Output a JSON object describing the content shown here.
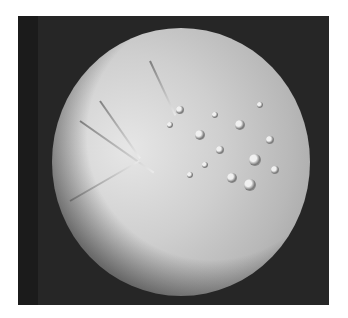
{
  "image": {
    "subject": "icy moon with grooved and cratered terrain",
    "background_color": "#262626",
    "border_color": "#ffffff"
  },
  "craters": [
    {
      "x": 180,
      "y": 110,
      "r": 4
    },
    {
      "x": 200,
      "y": 135,
      "r": 5
    },
    {
      "x": 220,
      "y": 150,
      "r": 4
    },
    {
      "x": 240,
      "y": 125,
      "r": 5
    },
    {
      "x": 255,
      "y": 160,
      "r": 6
    },
    {
      "x": 232,
      "y": 178,
      "r": 5
    },
    {
      "x": 250,
      "y": 185,
      "r": 6
    },
    {
      "x": 270,
      "y": 140,
      "r": 4
    },
    {
      "x": 205,
      "y": 165,
      "r": 3
    },
    {
      "x": 190,
      "y": 175,
      "r": 3
    },
    {
      "x": 170,
      "y": 125,
      "r": 3
    },
    {
      "x": 215,
      "y": 115,
      "r": 3
    },
    {
      "x": 260,
      "y": 105,
      "r": 3
    },
    {
      "x": 275,
      "y": 170,
      "r": 4
    }
  ],
  "grooves": [
    {
      "x": 100,
      "y": 100,
      "len": 70,
      "angle": 55
    },
    {
      "x": 80,
      "y": 120,
      "len": 90,
      "angle": 35
    },
    {
      "x": 70,
      "y": 200,
      "len": 80,
      "angle": -30
    },
    {
      "x": 150,
      "y": 60,
      "len": 60,
      "angle": 65
    }
  ]
}
